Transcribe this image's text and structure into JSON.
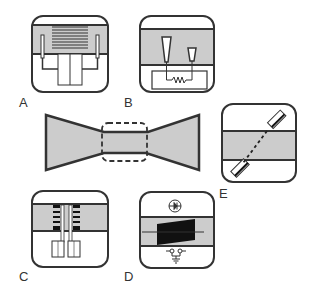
{
  "figure": {
    "colors": {
      "stroke": "#333333",
      "fill_gray": "#cccccc",
      "black": "#111111",
      "background": "#ffffff"
    },
    "panels": [
      {
        "id": "A",
        "label": "A",
        "content": "interdigitated comb electrode over gray band with two side probes connected by wires"
      },
      {
        "id": "B",
        "label": "B",
        "content": "two tapered probes in gray band connected to a resistor circuit below"
      },
      {
        "id": "C",
        "label": "C",
        "content": "two coil/spring electrodes in gray band with rectangular pads below"
      },
      {
        "id": "D",
        "label": "D",
        "content": "black trapezoid element across gray band with diode symbol above and ground symbol below"
      },
      {
        "id": "E",
        "label": "E",
        "content": "diagonal dashed line between two rectangular end pieces crossing gray band"
      }
    ],
    "center": {
      "shape": "bow-tie",
      "inset": "dashed rounded rectangle around narrow section"
    }
  }
}
